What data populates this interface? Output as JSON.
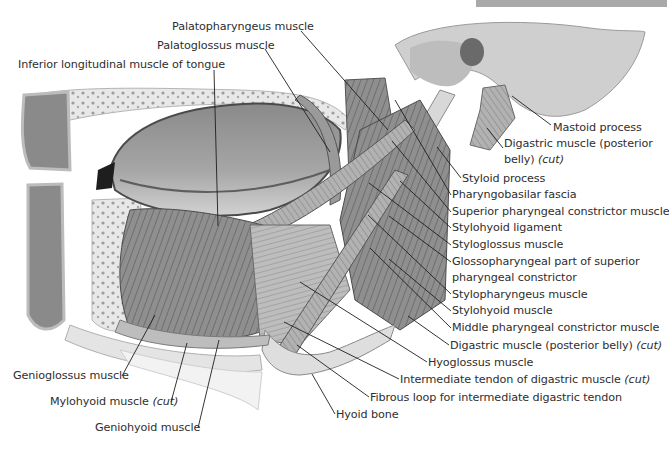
{
  "figure": {
    "header_bar_color": "#a9a9a9",
    "illustration_style": "grayscale anatomical drawing",
    "labels": {
      "palatopharyngeus": "Palatopharyngeus muscle",
      "palatoglossus": "Palatoglossus muscle",
      "inferior_longitudinal": "Inferior longitudinal muscle of tongue",
      "mastoid_process": "Mastoid process",
      "digastric_post_line1": "Digastric muscle (posterior",
      "digastric_post_line2": "belly) ",
      "digastric_post_cut": "(cut)",
      "styloid_process": "Styloid process",
      "pharyngobasilar": "Pharyngobasilar fascia",
      "superior_constrictor": "Superior pharyngeal constrictor muscle",
      "stylohyoid_ligament": "Stylohyoid ligament",
      "styloglossus": "Styloglossus muscle",
      "glossopharyngeal_line1": "Glossopharyngeal part of superior",
      "glossopharyngeal_line2": "pharyngeal constrictor",
      "stylopharyngeus": "Stylopharyngeus muscle",
      "stylohyoid_muscle": "Stylohyoid muscle",
      "middle_constrictor": "Middle pharyngeal constrictor muscle",
      "digastric_belly": "Digastric muscle (posterior belly) ",
      "digastric_belly_cut": "(cut)",
      "hyoglossus": "Hyoglossus muscle",
      "intermediate_tendon": "Intermediate tendon of digastric muscle ",
      "intermediate_tendon_cut": "(cut)",
      "fibrous_loop": "Fibrous loop for intermediate digastric tendon",
      "hyoid_bone": "Hyoid bone",
      "genioglossus": "Genioglossus muscle",
      "mylohyoid": "Mylohyoid muscle ",
      "mylohyoid_cut": "(cut)",
      "geniohyoid": "Geniohyoid muscle"
    }
  }
}
